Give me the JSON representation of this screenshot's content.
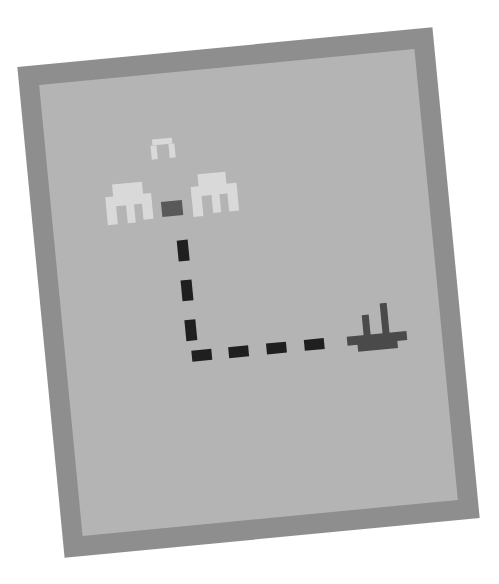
{
  "scene": {
    "description": "Tilted pixel-art puzzle card showing a path from a power source to a plug",
    "colors": {
      "background": "#ffffff",
      "frame": "#8e8e8e",
      "board": "#b4b4b4",
      "sprite_light": "#d9d9d9",
      "source": "#595959",
      "path": "#1f1f1f",
      "plug": "#4a4a4a"
    },
    "rotation_deg": -5.5,
    "sprites": [
      {
        "name": "small-arch",
        "icon": "arch-icon"
      },
      {
        "name": "left-arch",
        "icon": "arch-icon"
      },
      {
        "name": "right-arch",
        "icon": "arch-icon"
      },
      {
        "name": "source-block",
        "icon": "square-icon"
      },
      {
        "name": "plug",
        "icon": "plug-icon"
      }
    ],
    "path": {
      "vertical_dashes": 3,
      "horizontal_dashes": 4,
      "corner": "bottom-left"
    }
  }
}
